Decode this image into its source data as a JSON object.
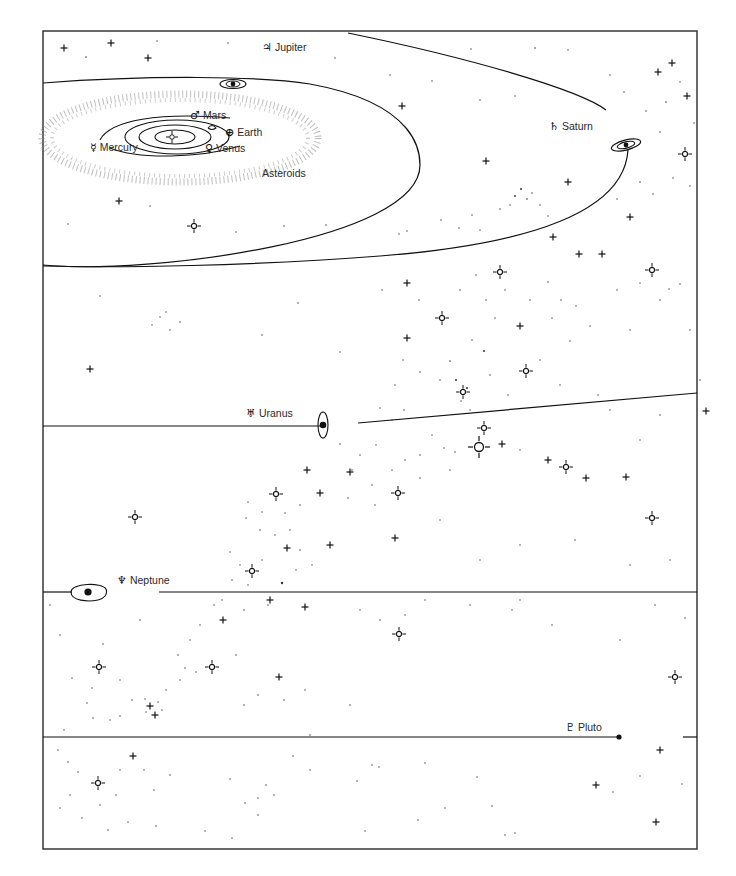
{
  "diagram": {
    "type": "solar-system-schematic",
    "frame": {
      "x": 43,
      "y": 31,
      "width": 654,
      "height": 818,
      "stroke": "#1a1a1a"
    },
    "colors": {
      "ink": "#111111",
      "label": "#2a2a2a",
      "background": "#ffffff"
    }
  },
  "labels": {
    "jupiter": {
      "symbol": "♃",
      "name": "Jupiter",
      "x": 262,
      "y": 42
    },
    "mars": {
      "symbol": "♂",
      "name": "Mars",
      "x": 190,
      "y": 110
    },
    "earth": {
      "symbol": "⊕",
      "name": "Earth",
      "x": 225,
      "y": 128
    },
    "mercury": {
      "symbol": "☿",
      "name": "Mercury",
      "x": 90,
      "y": 142
    },
    "venus": {
      "symbol": "♀",
      "name": "Venus",
      "x": 205,
      "y": 143
    },
    "asteroids": {
      "symbol": "",
      "name": "Asteroids",
      "x": 262,
      "y": 168
    },
    "saturn": {
      "symbol": "♄",
      "name": "Saturn",
      "x": 549,
      "y": 121
    },
    "uranus": {
      "symbol": "♅",
      "name": "Uranus",
      "x": 246,
      "y": 408
    },
    "neptune": {
      "symbol": "♆",
      "name": "Neptune",
      "x": 117,
      "y": 575
    },
    "pluto": {
      "symbol": "♇",
      "name": "Pluto",
      "x": 565,
      "y": 722
    }
  },
  "icons": {
    "sun": "sun-icon",
    "planet": "planet-dot-icon",
    "star": "star-cross-icon",
    "bright_star": "bright-star-ring-icon"
  }
}
